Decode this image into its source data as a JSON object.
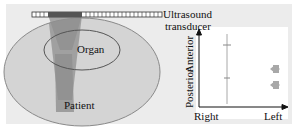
{
  "diagram": {
    "left": {
      "transducer_label_line1": "Ultrasound",
      "transducer_label_line2": "transducer",
      "organ_label": "Organ",
      "patient_label": "Patient"
    },
    "right": {
      "y_axis_label_top": "Anterior",
      "y_axis_label_bottom": "Posterior",
      "x_axis_label_left": "Right",
      "x_axis_label_right": "Left"
    },
    "colors": {
      "background": "#ececec",
      "patient_fill": "#d4d4d4",
      "beam": "#8a8a8a",
      "outline": "#666666",
      "plot_bg": "#ffffff",
      "markers": "#a8a8a8"
    }
  }
}
